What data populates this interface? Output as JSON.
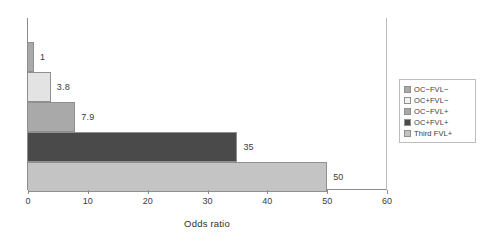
{
  "chart_data": {
    "type": "bar",
    "orientation": "horizontal",
    "title": "",
    "xlabel": "Odds ratio",
    "ylabel": "",
    "xlim": [
      0,
      60
    ],
    "ylim": null,
    "grid": false,
    "legend_position": "right",
    "x_ticks": [
      0,
      10,
      20,
      30,
      40,
      50,
      60
    ],
    "x_tick_labels": [
      "0",
      "10",
      "20",
      "30",
      "40",
      "50",
      "60"
    ],
    "categories": [
      "OC−FVL−",
      "OC+FVL−",
      "OC−FVL+",
      "OC+FVL+",
      "Third FVL+"
    ],
    "values": [
      1,
      3.8,
      7.9,
      35,
      50
    ],
    "data_labels": [
      "1",
      "3.8",
      "7.9",
      "35",
      "50"
    ],
    "colors": [
      "#a9a9a9",
      "#e3e3e3",
      "#a9a9a9",
      "#4a4a4a",
      "#c4c4c4"
    ],
    "bar_edge_color": "#8f8f8f"
  },
  "axis": {
    "x_title": "Odds ratio",
    "ticks": [
      {
        "value": 0,
        "label": "0"
      },
      {
        "value": 10,
        "label": "10"
      },
      {
        "value": 20,
        "label": "20"
      },
      {
        "value": 30,
        "label": "30"
      },
      {
        "value": 40,
        "label": "40"
      },
      {
        "value": 50,
        "label": "50"
      },
      {
        "value": 60,
        "label": "60"
      }
    ]
  },
  "legend": {
    "items": [
      {
        "label": "OC−FVL−",
        "color": "#a9a9a9"
      },
      {
        "label": "OC+FVL−",
        "color": "#f2f2f2"
      },
      {
        "label": "OC−FVL+",
        "color": "#a9a9a9"
      },
      {
        "label": "OC+FVL+",
        "color": "#4a4a4a"
      },
      {
        "label": "Third FVL+",
        "color": "#c4c4c4"
      }
    ]
  }
}
